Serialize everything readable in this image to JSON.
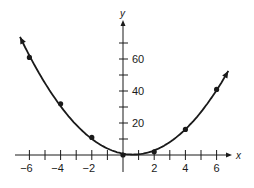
{
  "chart_data": {
    "type": "line",
    "title": "",
    "xlabel": "x",
    "ylabel": "y",
    "xlim": [
      -7,
      7
    ],
    "ylim": [
      -2,
      75
    ],
    "grid": false,
    "legend": null,
    "x_ticks": [
      -6,
      -5,
      -4,
      -3,
      -2,
      -1,
      0,
      1,
      2,
      3,
      4,
      5,
      6
    ],
    "x_tick_labels": [
      "-6",
      "-4",
      "-2",
      "2",
      "4",
      "6"
    ],
    "x_tick_label_values": [
      -6,
      -4,
      -2,
      2,
      4,
      6
    ],
    "y_ticks": [
      10,
      20,
      30,
      40,
      50,
      60,
      70
    ],
    "y_tick_labels": [
      "20",
      "40",
      "60"
    ],
    "y_tick_label_values": [
      20,
      40,
      60
    ],
    "series": [
      {
        "name": "parabola",
        "style": "curve with arrowheads at both ends",
        "color": "#1a1a1a",
        "points": [
          {
            "x": -6,
            "y": 61
          },
          {
            "x": -4,
            "y": 32
          },
          {
            "x": -2,
            "y": 11
          },
          {
            "x": 0,
            "y": 0
          },
          {
            "x": 2,
            "y": 2
          },
          {
            "x": 4,
            "y": 16
          },
          {
            "x": 6,
            "y": 41
          }
        ],
        "x": [
          -6,
          -4,
          -2,
          0,
          2,
          4,
          6
        ],
        "values": [
          61,
          32,
          11,
          0,
          2,
          16,
          41
        ]
      }
    ]
  },
  "axes": {
    "x_label": "x",
    "y_label": "y"
  },
  "colors": {
    "ink": "#1a1a1a",
    "background": "#ffffff"
  }
}
